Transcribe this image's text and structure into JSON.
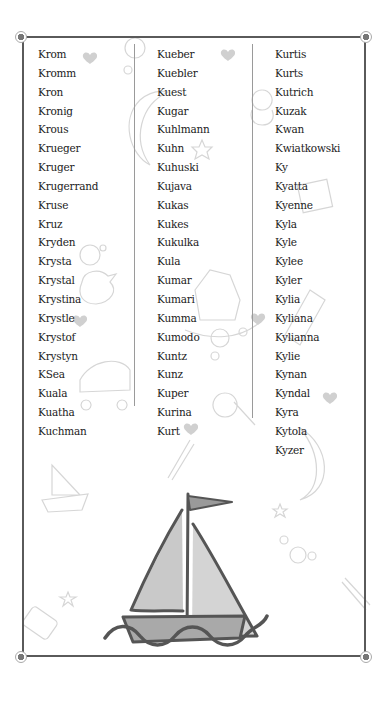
{
  "columns": [
    {
      "names": [
        "Krom",
        "Kromm",
        "Kron",
        "Kronig",
        "Krous",
        "Krueger",
        "Kruger",
        "Krugerrand",
        "Kruse",
        "Kruz",
        "Kryden",
        "Krysta",
        "Krystal",
        "Krystina",
        "Krystle",
        "Krystof",
        "Krystyn",
        "KSea",
        "Kuala",
        "Kuatha",
        "Kuchman"
      ]
    },
    {
      "names": [
        "Kueber",
        "Kuebler",
        "Kuest",
        "Kugar",
        "Kuhlmann",
        "Kuhn",
        "Kuhuski",
        "Kujava",
        "Kukas",
        "Kukes",
        "Kukulka",
        "Kula",
        "Kumar",
        "Kumari",
        "Kumma",
        "Kumodo",
        "Kuntz",
        "Kunz",
        "Kuper",
        "Kurina",
        "Kurt"
      ]
    },
    {
      "names": [
        "Kurtis",
        "Kurts",
        "Kutrich",
        "Kuzak",
        "Kwan",
        "Kwiatkowski",
        "Ky",
        "Kyatta",
        "Kyenne",
        "Kyla",
        "Kyle",
        "Kylee",
        "Kyler",
        "Kylia",
        "Kyliana",
        "Kylianna",
        "Kylie",
        "Kynan",
        "Kyndal",
        "Kyra",
        "Kytola",
        "Kyzer"
      ]
    }
  ],
  "illustration": {
    "icon": "sailboat-icon",
    "background_motifs": [
      "heart-icon",
      "moon-icon",
      "bubble-icon",
      "rubber-duck-icon",
      "stroller-icon",
      "teddy-bear-icon",
      "rocking-horse-icon",
      "baby-bottle-icon",
      "rattle-icon",
      "safety-pin-icon",
      "star-icon",
      "block-icon",
      "small-sailboat-icon"
    ]
  },
  "colors": {
    "frame": "#5a5a5a",
    "text": "#222222",
    "sail_fill": "#c9c9c9",
    "hull_fill": "#a9a9a9",
    "outline": "#555555",
    "motif": "#d8d8d8"
  }
}
